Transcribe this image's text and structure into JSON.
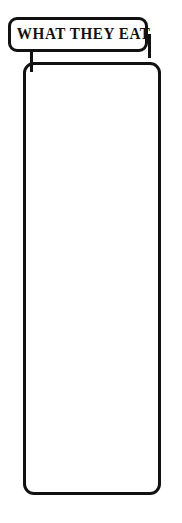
{
  "poster": {
    "title": "WHAT THEY EAT",
    "frame_color": "#111111",
    "background_color": "#ffffff",
    "text_color": "#141414"
  },
  "entries": [
    {
      "id": "fish",
      "icon": "fish-icon",
      "label": "Small Bony Fish",
      "sublabel": ""
    },
    {
      "id": "crustaceans",
      "icon": "crab-icon",
      "icon_secondary": "lobster-icon",
      "label": "Crustaceans",
      "sublabel": "Crabs and Lobsters"
    },
    {
      "id": "rays",
      "icon": "ray-icon",
      "label": "Rays",
      "sublabel": ""
    },
    {
      "id": "squid",
      "icon": "squid-icon",
      "label": "Squid",
      "sublabel": ""
    },
    {
      "id": "mollusks",
      "icon": "scallop-shell-icon",
      "label": "Mollusks",
      "sublabel": ""
    }
  ]
}
